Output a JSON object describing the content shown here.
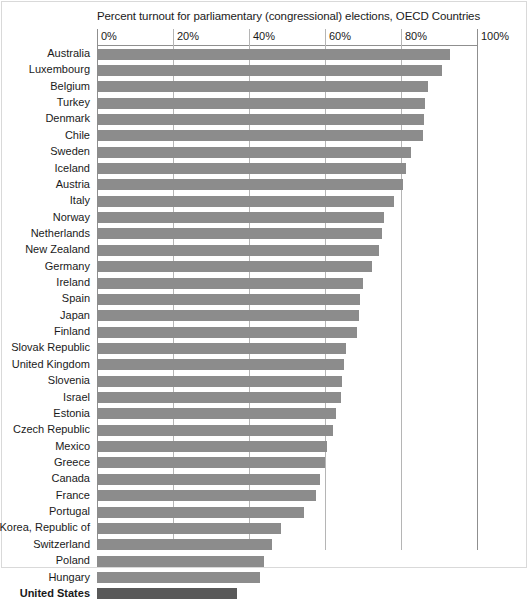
{
  "chart_data": {
    "type": "bar",
    "orientation": "horizontal",
    "title": "Percent turnout for parliamentary (congressional) elections, OECD Countries",
    "xlabel": "",
    "ylabel": "",
    "xlim": [
      0,
      100
    ],
    "xtick_labels": [
      "0%",
      "20%",
      "40%",
      "60%",
      "80%",
      "100%"
    ],
    "xticks": [
      0,
      20,
      40,
      60,
      80,
      100
    ],
    "grid": true,
    "legend": null,
    "unit": "percent",
    "bar_color": "#8c8c8c",
    "highlight_color": "#595959",
    "highlight_category": "United States",
    "categories": [
      "Australia",
      "Luxembourg",
      "Belgium",
      "Turkey",
      "Denmark",
      "Chile",
      "Sweden",
      "Iceland",
      "Austria",
      "Italy",
      "Norway",
      "Netherlands",
      "New Zealand",
      "Germany",
      "Ireland",
      "Spain",
      "Japan",
      "Finland",
      "Slovak Republic",
      "United Kingdom",
      "Slovenia",
      "Israel",
      "Estonia",
      "Czech Republic",
      "Mexico",
      "Greece",
      "Canada",
      "France",
      "Portugal",
      "Korea, Republic of",
      "Switzerland",
      "Poland",
      "Hungary",
      "United States"
    ],
    "values": [
      92.8,
      90.9,
      87.2,
      86.4,
      86.0,
      85.7,
      82.6,
      81.4,
      80.5,
      78.1,
      75.5,
      75.0,
      74.2,
      72.4,
      70.0,
      69.3,
      69.0,
      68.3,
      65.4,
      65.0,
      64.5,
      64.1,
      63.0,
      62.0,
      60.5,
      60.0,
      58.8,
      57.7,
      54.5,
      48.5,
      46.0,
      44.0,
      43.0,
      36.9
    ],
    "source_note": ""
  }
}
